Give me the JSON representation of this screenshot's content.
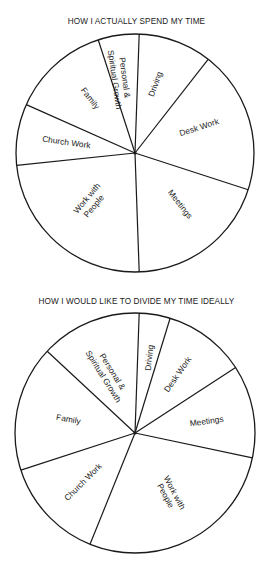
{
  "charts": [
    {
      "title": "HOW I ACTUALLY SPEND MY TIME",
      "center": [
        135,
        153
      ],
      "radius": 119,
      "slices": [
        {
          "label": "Driving",
          "start": 2,
          "end": 38
        },
        {
          "label": "Desk Work",
          "start": 38,
          "end": 108
        },
        {
          "label": "Meetings",
          "start": 108,
          "end": 178
        },
        {
          "label": "Work with People",
          "start": 178,
          "end": 264
        },
        {
          "label": "Church Work",
          "start": 264,
          "end": 294
        },
        {
          "label": "Family",
          "start": 294,
          "end": 342
        },
        {
          "label": "Personal & Spiritual Growth",
          "start": 342,
          "end": 362
        }
      ]
    },
    {
      "title": "HOW I WOULD LIKE TO DIVIDE MY TIME IDEALLY",
      "center": [
        135,
        433
      ],
      "radius": 120,
      "slices": [
        {
          "label": "Driving",
          "start": 2,
          "end": 17
        },
        {
          "label": "Desk Work",
          "start": 17,
          "end": 57
        },
        {
          "label": "Meetings",
          "start": 57,
          "end": 102
        },
        {
          "label": "Work with People",
          "start": 102,
          "end": 202
        },
        {
          "label": "Church Work",
          "start": 202,
          "end": 252
        },
        {
          "label": "Family",
          "start": 252,
          "end": 313
        },
        {
          "label": "Personal & Spiritual Growth",
          "start": 313,
          "end": 362
        }
      ]
    }
  ],
  "labels": {
    "c1": {
      "driving": "Driving",
      "desk": "Desk Work",
      "meetings": "Meetings",
      "people1": "Work with",
      "people2": "People",
      "church": "Church Work",
      "family": "Family",
      "personal1": "Personal &",
      "personal2": "Spiritual Growth"
    },
    "c2": {
      "driving": "Driving",
      "desk": "Desk Work",
      "meetings": "Meetings",
      "people1": "Work with",
      "people2": "People",
      "church": "Church Work",
      "family": "Family",
      "personal1": "Personal &",
      "personal2": "Spiritual Growth"
    }
  },
  "chart_data": [
    {
      "type": "pie",
      "title": "HOW I ACTUALLY SPEND MY TIME",
      "categories": [
        "Driving",
        "Desk Work",
        "Meetings",
        "Work with People",
        "Church Work",
        "Family",
        "Personal & Spiritual Growth"
      ],
      "values": [
        10.0,
        19.4,
        19.4,
        23.9,
        8.3,
        13.3,
        5.6
      ],
      "unit": "percent (estimated from slice angles)",
      "start_angle": "12 o'clock, clockwise",
      "legend": "none (labels inside slices)"
    },
    {
      "type": "pie",
      "title": "HOW I WOULD LIKE TO DIVIDE MY TIME IDEALLY",
      "categories": [
        "Driving",
        "Desk Work",
        "Meetings",
        "Work with People",
        "Church Work",
        "Family",
        "Personal & Spiritual Growth"
      ],
      "values": [
        4.2,
        11.1,
        12.5,
        27.8,
        13.9,
        16.9,
        13.6
      ],
      "unit": "percent (estimated from slice angles)",
      "start_angle": "12 o'clock, clockwise",
      "legend": "none (labels inside slices)"
    }
  ]
}
